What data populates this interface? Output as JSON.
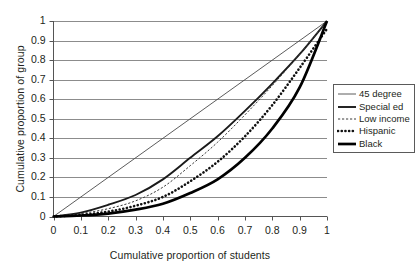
{
  "chart_data": {
    "type": "line",
    "title": "",
    "xlabel": "Cumulative proportion of students",
    "ylabel": "Cumulative proportion of group",
    "xlim": [
      0,
      1
    ],
    "ylim": [
      0,
      1
    ],
    "xticks": [
      "0",
      "0.1",
      "0.2",
      "0.3",
      "0.4",
      "0.5",
      "0.6",
      "0.7",
      "0.8",
      "0.9",
      "1"
    ],
    "yticks": [
      "0",
      "0.1",
      "0.2",
      "0.3",
      "0.4",
      "0.5",
      "0.6",
      "0.7",
      "0.8",
      "0.9",
      "1"
    ],
    "grid": "horizontal",
    "legend_position": "right",
    "x": [
      0,
      0.1,
      0.2,
      0.3,
      0.4,
      0.5,
      0.6,
      0.7,
      0.8,
      0.9,
      1
    ],
    "series": [
      {
        "name": "45 degree",
        "style": "thin-solid",
        "color": "#4a4a4a",
        "values": [
          0,
          0.1,
          0.2,
          0.3,
          0.4,
          0.5,
          0.6,
          0.7,
          0.8,
          0.9,
          1
        ]
      },
      {
        "name": "Special ed",
        "style": "medium-solid",
        "color": "#1a1a1a",
        "values": [
          0,
          0.02,
          0.06,
          0.11,
          0.19,
          0.3,
          0.41,
          0.54,
          0.68,
          0.83,
          1
        ]
      },
      {
        "name": "Low income",
        "style": "thin-dotted",
        "color": "#3a3a3a",
        "values": [
          0,
          0.015,
          0.04,
          0.08,
          0.15,
          0.26,
          0.38,
          0.52,
          0.67,
          0.83,
          1
        ]
      },
      {
        "name": "Hispanic",
        "style": "thick-dotted",
        "color": "#111111",
        "values": [
          0,
          0.008,
          0.025,
          0.055,
          0.1,
          0.18,
          0.28,
          0.41,
          0.57,
          0.76,
          0.96
        ]
      },
      {
        "name": "Black",
        "style": "thick-solid",
        "color": "#000000",
        "values": [
          0,
          0.005,
          0.015,
          0.035,
          0.065,
          0.12,
          0.19,
          0.3,
          0.45,
          0.66,
          1
        ]
      }
    ]
  },
  "legend": {
    "items": [
      {
        "label": "45 degree"
      },
      {
        "label": "Special ed"
      },
      {
        "label": "Low income"
      },
      {
        "label": "Hispanic"
      },
      {
        "label": "Black"
      }
    ]
  },
  "axes": {
    "x_title": "Cumulative proportion of students",
    "y_title": "Cumulative proportion of group"
  }
}
